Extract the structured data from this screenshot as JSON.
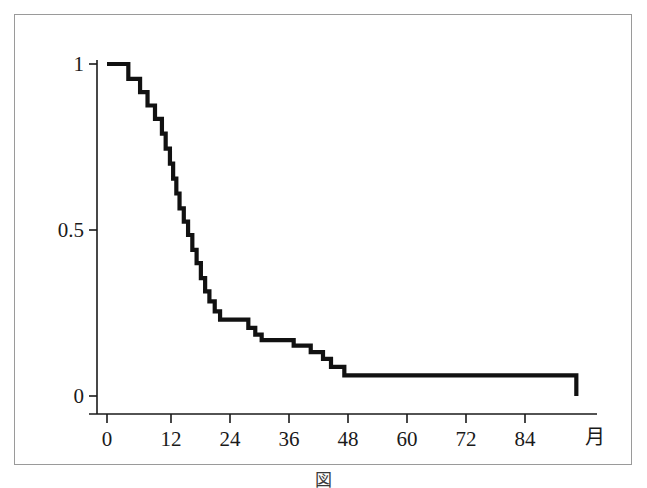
{
  "figure": {
    "caption": "図　　　　　　　　　　　　　　　　　",
    "unit_label": "月"
  },
  "chart_data": {
    "type": "line",
    "subtype": "kaplan-meier-step",
    "title": "",
    "xlabel": "月",
    "ylabel": "",
    "xlim": [
      0,
      92
    ],
    "ylim": [
      0,
      1.05
    ],
    "grid": false,
    "legend": null,
    "x_ticks": [
      0,
      12,
      24,
      36,
      48,
      60,
      72,
      84
    ],
    "x_tick_labels": [
      "0",
      "12",
      "24",
      "36",
      "48",
      "60",
      "72",
      "84"
    ],
    "y_ticks": [
      0,
      0.5,
      1
    ],
    "y_tick_labels": [
      "0",
      "0.5",
      "1"
    ],
    "series": [
      {
        "name": "survival",
        "color": "#111111",
        "step_points": [
          [
            0,
            1.0
          ],
          [
            4.0,
            1.0
          ],
          [
            4.0,
            0.955
          ],
          [
            6.2,
            0.955
          ],
          [
            6.2,
            0.915
          ],
          [
            7.6,
            0.915
          ],
          [
            7.6,
            0.875
          ],
          [
            9.0,
            0.875
          ],
          [
            9.0,
            0.835
          ],
          [
            10.3,
            0.835
          ],
          [
            10.3,
            0.79
          ],
          [
            11.0,
            0.79
          ],
          [
            11.0,
            0.745
          ],
          [
            11.8,
            0.745
          ],
          [
            11.8,
            0.7
          ],
          [
            12.4,
            0.7
          ],
          [
            12.4,
            0.655
          ],
          [
            13.0,
            0.655
          ],
          [
            13.0,
            0.61
          ],
          [
            13.6,
            0.61
          ],
          [
            13.6,
            0.565
          ],
          [
            14.4,
            0.565
          ],
          [
            14.4,
            0.525
          ],
          [
            15.2,
            0.525
          ],
          [
            15.2,
            0.485
          ],
          [
            16.0,
            0.485
          ],
          [
            16.0,
            0.44
          ],
          [
            16.8,
            0.44
          ],
          [
            16.8,
            0.4
          ],
          [
            17.6,
            0.4
          ],
          [
            17.6,
            0.355
          ],
          [
            18.4,
            0.355
          ],
          [
            18.4,
            0.315
          ],
          [
            19.2,
            0.315
          ],
          [
            19.2,
            0.285
          ],
          [
            20.2,
            0.285
          ],
          [
            20.2,
            0.255
          ],
          [
            21.2,
            0.255
          ],
          [
            21.2,
            0.23
          ],
          [
            26.5,
            0.23
          ],
          [
            26.5,
            0.205
          ],
          [
            27.8,
            0.205
          ],
          [
            27.8,
            0.185
          ],
          [
            29.0,
            0.185
          ],
          [
            29.0,
            0.168
          ],
          [
            35.0,
            0.168
          ],
          [
            35.0,
            0.152
          ],
          [
            38.2,
            0.152
          ],
          [
            38.2,
            0.132
          ],
          [
            40.5,
            0.132
          ],
          [
            40.5,
            0.112
          ],
          [
            42.0,
            0.112
          ],
          [
            42.0,
            0.088
          ],
          [
            44.5,
            0.088
          ],
          [
            44.5,
            0.062
          ],
          [
            88.0,
            0.062
          ],
          [
            88.0,
            0.0
          ]
        ]
      }
    ]
  }
}
